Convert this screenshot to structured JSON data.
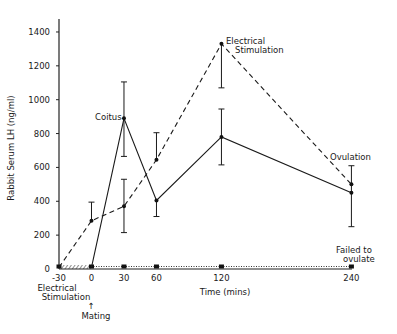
{
  "chart_data": {
    "type": "line",
    "title": "",
    "xlabel": "Time (mins)",
    "ylabel": "Rabbit Serum LH (ng/ml)",
    "x": [
      -30,
      0,
      30,
      60,
      120,
      240
    ],
    "xticks": [
      "-30",
      "0",
      "30",
      "60",
      "120",
      "240"
    ],
    "yticks": [
      "0",
      "200",
      "400",
      "600",
      "800",
      "1000",
      "1200",
      "1400"
    ],
    "xlim": [
      -30,
      240
    ],
    "ylim": [
      0,
      1400
    ],
    "grid": false,
    "legend": null,
    "series": [
      {
        "name": "Coitus (mating)",
        "style": "solid",
        "x": [
          0,
          30,
          60,
          120,
          240
        ],
        "values": [
          10,
          890,
          405,
          780,
          450
        ],
        "error_low": [
          null,
          665,
          310,
          615,
          250
        ],
        "error_high": [
          null,
          1105,
          null,
          945,
          610
        ]
      },
      {
        "name": "Electrical Stimulation",
        "style": "dashed",
        "x": [
          -30,
          0,
          30,
          60,
          120,
          240
        ],
        "values": [
          10,
          285,
          370,
          645,
          1330,
          500
        ],
        "error_low": [
          null,
          null,
          215,
          null,
          1070,
          null
        ],
        "error_high": [
          null,
          395,
          530,
          805,
          null,
          null
        ]
      },
      {
        "name": "Failed to ovulate",
        "style": "dotted",
        "x": [
          -30,
          0,
          30,
          60,
          120,
          240
        ],
        "values": [
          5,
          5,
          5,
          5,
          5,
          5
        ]
      }
    ],
    "annotations": [
      {
        "text": "Coitus",
        "x": 30,
        "y": 890
      },
      {
        "text": "Electrical Stimulation",
        "x": 120,
        "y": 1330
      },
      {
        "text": "Ovulation",
        "x": 240,
        "y": 610
      },
      {
        "text": "Failed to ovulate",
        "x": 240,
        "y": 0
      },
      {
        "text": "Electrical Stimulation",
        "x": -30,
        "y": "below axis"
      },
      {
        "text": "Mating",
        "x": 0,
        "y": "below axis, arrow up"
      }
    ]
  },
  "labels": {
    "ylabel": "Rabbit Serum LH (ng/ml)",
    "xlabel": "Time (mins)",
    "coitus": "Coitus",
    "es_top_1": "Electrical",
    "es_top_2": "Stimulation",
    "ovulation": "Ovulation",
    "failed_1": "Failed to",
    "failed_2": "ovulate",
    "es_bottom_1": "Electrical",
    "es_bottom_2": "Stimulation",
    "mating_arrow": "↑",
    "mating": "Mating"
  },
  "ticks": {
    "x": [
      "-30",
      "0",
      "30",
      "60",
      "120",
      "240"
    ],
    "y": [
      "0",
      "200",
      "400",
      "600",
      "800",
      "1000",
      "1200",
      "1400"
    ]
  }
}
